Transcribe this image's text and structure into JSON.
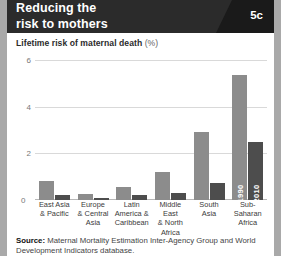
{
  "header": {
    "title_line1": "Reducing the",
    "title_line2": "risk to mothers",
    "badge": "5c",
    "bg_color": "#2b2b2b",
    "corner_color": "#1a1a1a"
  },
  "subtitle": {
    "text": "Lifetime risk of maternal death",
    "unit": "(%)"
  },
  "source": {
    "label": "Source:",
    "text": " Maternal Mortality Estimation Inter-Agency Group and World Development Indicators database."
  },
  "chart_data": {
    "type": "bar",
    "title": "Reducing the risk to mothers",
    "subtitle": "Lifetime risk of maternal death (%)",
    "xlabel": "",
    "ylabel": "",
    "ylim": [
      0,
      6
    ],
    "yticks": [
      0,
      2,
      4,
      6
    ],
    "ytick_labels": [
      "0",
      "2",
      "4",
      "6"
    ],
    "grid": true,
    "legend_position": "on-bars-last-group",
    "categories": [
      "East Asia & Pacific",
      "Europe & Central Asia",
      "Latin America & Caribbean",
      "Middle East & North Africa",
      "South Asia",
      "Sub-Saharan Africa"
    ],
    "category_lines": [
      [
        "East Asia",
        "& Pacific"
      ],
      [
        "Europe",
        "& Central",
        "Asia"
      ],
      [
        "Latin",
        "America &",
        "Caribbean"
      ],
      [
        "Middle East",
        "& North",
        "Africa"
      ],
      [
        "South",
        "Asia"
      ],
      [
        "Sub-Saharan",
        "Africa"
      ]
    ],
    "series": [
      {
        "name": "1990",
        "color": "#8c8c8c",
        "values": [
          0.8,
          0.25,
          0.55,
          1.2,
          2.9,
          5.35
        ]
      },
      {
        "name": "2010",
        "color": "#4d4d4d",
        "values": [
          0.2,
          0.08,
          0.22,
          0.28,
          0.75,
          2.5
        ]
      }
    ]
  }
}
